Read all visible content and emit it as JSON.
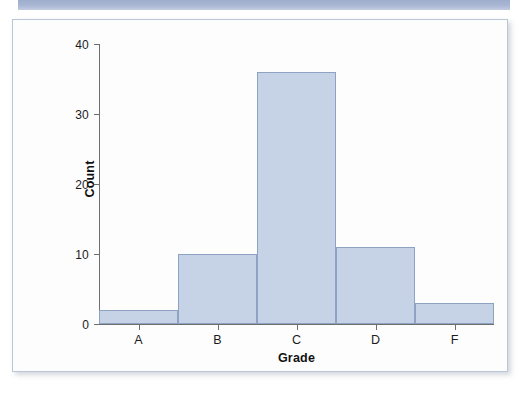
{
  "banner": {
    "name": "top-decorative-band",
    "color": "#a9b6d4"
  },
  "figure": {
    "border_color": "#b9c6d8",
    "background": "#fdfdfe"
  },
  "chart_data": {
    "type": "bar",
    "title": "",
    "subtitle": "",
    "xlabel": "Grade",
    "ylabel": "Count",
    "categories": [
      "A",
      "B",
      "C",
      "D",
      "F"
    ],
    "values": [
      2,
      10,
      36,
      11,
      3
    ],
    "ylim": [
      0,
      40
    ],
    "yticks": [
      0,
      10,
      20,
      30,
      40
    ],
    "ytick_labels": [
      "0",
      "10",
      "20",
      "30",
      "40"
    ],
    "xtick_labels": [
      "A",
      "B",
      "C",
      "D",
      "F"
    ],
    "grid": false,
    "legend": null,
    "bar_fill_color": "#c6d2e6",
    "bar_edge_color": "#8ea2c2",
    "axis_color": "#6e6e6e",
    "bars_touching": true,
    "annotations": []
  }
}
